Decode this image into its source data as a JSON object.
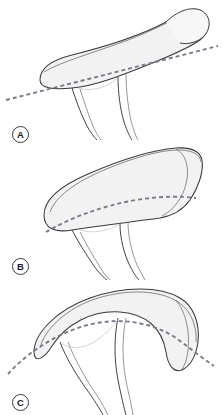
{
  "figure": {
    "background_color": "#ffffff",
    "width": 224,
    "height": 415,
    "style": {
      "outline_color": "#3a3a3a",
      "inner_line_color": "#6b6b6b",
      "fill_color": "#f2f2f2",
      "fill_color_light": "#f7f7f7",
      "dashed_line_color": "#7a7a8a",
      "label_text_color": "#1b1b1b",
      "label_border_color": "#3a3a3a"
    }
  },
  "panels": [
    {
      "id": "panel-a",
      "label": "A",
      "label_shape": "circle",
      "reference_line": "straight-dashed",
      "description": "Flat superior surface with bulbous upturned lateral end; dashed reference line passes straight through the body and extends beyond both ends",
      "dash_pattern": "4 3"
    },
    {
      "id": "panel-b",
      "label": "B",
      "label_shape": "circle",
      "reference_line": "curved-dashed",
      "description": "Moderately curved body with dashed reference line bowing along the inferior margin",
      "dash_pattern": "4 3"
    },
    {
      "id": "panel-c",
      "label": "C",
      "label_shape": "circle",
      "reference_line": "arched-dashed",
      "description": "Strongly arched body with dashed reference line following the convex arch and extending past both tips",
      "dash_pattern": "4 3"
    }
  ]
}
